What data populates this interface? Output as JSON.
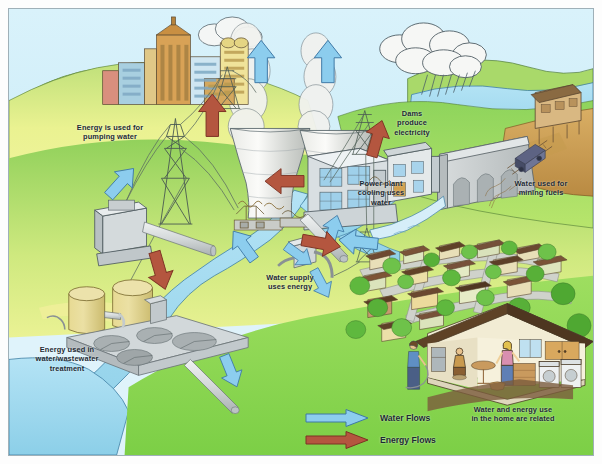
{
  "diagram": {
    "callouts": [
      {
        "id": "pumping",
        "text": "Energy is used for\npumping water",
        "x": 60,
        "y": 122
      },
      {
        "id": "dams",
        "text": "Dams\nproduce\nelectricity",
        "x": 388,
        "y": 108
      },
      {
        "id": "cooling",
        "text": "Power plant\ncooling uses\nwater",
        "x": 352,
        "y": 178
      },
      {
        "id": "mining",
        "text": "Water used for\nmining fuels",
        "x": 505,
        "y": 178
      },
      {
        "id": "supply",
        "text": "Water supply\nuses energy",
        "x": 253,
        "y": 272
      },
      {
        "id": "treatment",
        "text": "Energy used in\nwater/wastewater\ntreatment",
        "x": 20,
        "y": 344
      },
      {
        "id": "home",
        "text": "Water and energy use\nin the home are related",
        "x": 447,
        "y": 404
      }
    ],
    "legend": {
      "items": [
        {
          "label": "Water Flows",
          "color": "#7ec2e8",
          "stroke": "#3b79a8"
        },
        {
          "label": "Energy Flows",
          "color": "#b0503c",
          "stroke": "#7d3324"
        }
      ]
    },
    "colors": {
      "sky": "#d6f0fa",
      "water": "#9fd8ef",
      "grass_light": "#e8f08a",
      "grass_mid": "#a9d96a",
      "grass_dark": "#76c04a",
      "earth": "#c79a52",
      "concrete": "#c9cdcf",
      "steam": "#f2f2f0",
      "water_arrow": "#7ec2e8",
      "energy_arrow": "#b0503c",
      "frame": "#9fb0b8"
    },
    "scene_elements": [
      "city-skyline",
      "cooling-towers",
      "power-plant",
      "transmission-towers",
      "pumping-station",
      "water-treatment-plant",
      "dam",
      "reservoir",
      "mine-and-cart",
      "residential-neighborhood",
      "cutaway-house",
      "rain-cloud",
      "river",
      "steam-plumes"
    ]
  }
}
